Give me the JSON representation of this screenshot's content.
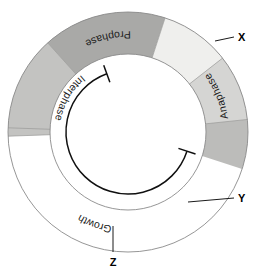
{
  "diagram": {
    "type": "donut-cycle",
    "center": {
      "x": 128,
      "y": 132
    },
    "outer_radius": 120,
    "inner_radius": 78,
    "inner_arc_radius": 62,
    "background_color": "#ffffff",
    "outline_color": "#8a8a8a",
    "segments": [
      {
        "id": "growth",
        "label": "Growth",
        "start_angle": 272,
        "end_angle": 448,
        "color": "#e3e3e1",
        "label_angle": 200,
        "labelled": true
      },
      {
        "id": "x",
        "label": "",
        "callout": "X",
        "start_angle": 268,
        "end_angle": 318,
        "color": "#c3c3c1",
        "labelled": false
      },
      {
        "id": "prophase",
        "label": "Prophase",
        "start_angle": 318,
        "end_angle": 18,
        "color": "#a9a9a7",
        "label_angle": 348,
        "labelled": true
      },
      {
        "id": "y",
        "label": "",
        "callout": "Y",
        "start_angle": 18,
        "end_angle": 52,
        "color": "#efefed",
        "labelled": false
      },
      {
        "id": "anaphase",
        "label": "Anaphase",
        "start_angle": 52,
        "end_angle": 84,
        "color": "#d5d5d3",
        "label_angle": 68,
        "labelled": true
      },
      {
        "id": "z",
        "label": "",
        "callout": "Z",
        "start_angle": 84,
        "end_angle": 108,
        "color": "#bcbcba",
        "labelled": false
      }
    ],
    "inner_arc": {
      "label": "Interphase",
      "start_angle": 108,
      "end_angle": 340,
      "stroke_color": "#101010",
      "end_cap": "perpendicular-tick"
    },
    "callouts": [
      {
        "id": "x",
        "label": "X",
        "line_from": {
          "x": 215,
          "y": 41
        },
        "line_to": {
          "x": 234,
          "y": 37
        },
        "text_at": {
          "x": 238,
          "y": 41
        }
      },
      {
        "id": "y",
        "label": "Y",
        "line_from": {
          "x": 188,
          "y": 202
        },
        "line_to": {
          "x": 234,
          "y": 198
        },
        "text_at": {
          "x": 238,
          "y": 202
        }
      },
      {
        "id": "z",
        "label": "Z",
        "line_from": {
          "x": 113,
          "y": 226
        },
        "line_to": {
          "x": 113,
          "y": 252
        },
        "text_at": {
          "x": 113,
          "y": 266
        }
      }
    ]
  }
}
